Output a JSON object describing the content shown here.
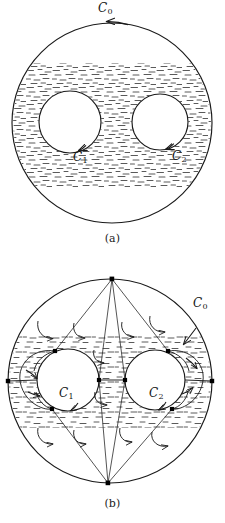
{
  "figure": {
    "stroke_color": "#1a1a1a",
    "hatch_color": "#555555",
    "node_color": "#000000",
    "background": "#ffffff"
  },
  "panels": [
    {
      "id": "a",
      "caption": "(a)",
      "description": "Triply connected region bounded by outer circle C0 and inner circles C1 and C2, shaded",
      "outer": {
        "label": "C",
        "sub": "0",
        "cx": 112,
        "cy": 123,
        "r": 100,
        "orientation": "counterclockwise"
      },
      "inner": [
        {
          "label": "C",
          "sub": "1",
          "cx": 70,
          "cy": 122,
          "r": 31,
          "orientation": "clockwise"
        },
        {
          "label": "C",
          "sub": "2",
          "cx": 160,
          "cy": 122,
          "r": 28,
          "orientation": "clockwise"
        }
      ]
    },
    {
      "id": "b",
      "caption": "(b)",
      "description": "Same region rendered simply connected by cross cuts joining the boundaries",
      "outer": {
        "label": "C",
        "sub": "0",
        "cx": 110,
        "cy": 381,
        "r": 102,
        "orientation": "counterclockwise"
      },
      "inner": [
        {
          "label": "C",
          "sub": "1",
          "cx": 68,
          "cy": 380,
          "r": 31,
          "orientation": "clockwise"
        },
        {
          "label": "C",
          "sub": "2",
          "cx": 155,
          "cy": 380,
          "r": 30,
          "orientation": "clockwise"
        }
      ],
      "vertices": [
        {
          "name": "top",
          "x": 112,
          "y": 279
        },
        {
          "name": "bottom",
          "x": 108,
          "y": 483
        },
        {
          "name": "left-outer",
          "x": 8,
          "y": 381
        },
        {
          "name": "right-outer",
          "x": 212,
          "y": 381
        },
        {
          "name": "c1-upper",
          "x": 55,
          "y": 351
        },
        {
          "name": "c1-lower",
          "x": 52,
          "y": 409
        },
        {
          "name": "c1-right",
          "x": 99,
          "y": 380
        },
        {
          "name": "c2-upper",
          "x": 168,
          "y": 351
        },
        {
          "name": "c2-lower",
          "x": 172,
          "y": 409
        },
        {
          "name": "c2-left",
          "x": 125,
          "y": 380
        }
      ]
    }
  ],
  "labels": {
    "c0_a": {
      "text": "C",
      "sub": "0",
      "x": 98,
      "y": 2
    },
    "c1_a": {
      "text": "C",
      "sub": "1",
      "x": 73,
      "y": 151
    },
    "c2_a": {
      "text": "C",
      "sub": "2",
      "x": 172,
      "y": 150
    },
    "c0_b": {
      "text": "C",
      "sub": "0",
      "x": 193,
      "y": 297
    },
    "c1_b": {
      "text": "C",
      "sub": "1",
      "x": 59,
      "y": 387
    },
    "c2_b": {
      "text": "C",
      "sub": "2",
      "x": 149,
      "y": 387
    }
  },
  "captions": {
    "a": "(a)",
    "b": "(b)"
  }
}
